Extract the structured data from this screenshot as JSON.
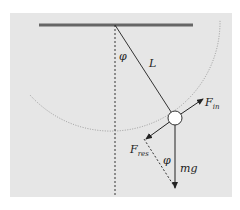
{
  "diagram": {
    "type": "pendulum-force-diagram",
    "colors": {
      "background": "#e6e6e6",
      "ceiling": "#666666",
      "lines": "#333333",
      "arc": "#888888",
      "bob_fill": "#ffffff"
    },
    "labels": {
      "angle_top": "φ",
      "length": "L",
      "inertial_force": "F",
      "inertial_force_sub": "in",
      "resultant_force": "F",
      "resultant_force_sub": "res",
      "angle_bottom": "φ",
      "gravity": "mg"
    }
  }
}
